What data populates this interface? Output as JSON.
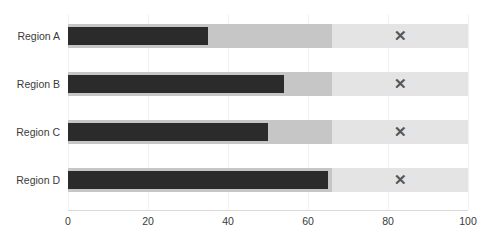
{
  "chart_data": {
    "type": "bar",
    "subtype": "bullet",
    "title": "",
    "xlabel": "",
    "ylabel": "",
    "categories": [
      "Region A",
      "Region B",
      "Region C",
      "Region D"
    ],
    "series": [
      {
        "name": "Value",
        "values": [
          35,
          54,
          50,
          65
        ]
      },
      {
        "name": "Target",
        "values": [
          83,
          83,
          83,
          83
        ]
      }
    ],
    "range_bands": [
      {
        "name": "Mid range",
        "from": 0,
        "to": 66,
        "color": "#c6c6c6"
      },
      {
        "name": "Light range",
        "from": 66,
        "to": 100,
        "color": "#e4e4e4"
      }
    ],
    "xlim": [
      0,
      100
    ],
    "xticks": [
      0,
      20,
      40,
      60,
      80,
      100
    ],
    "xtick_labels": [
      "0",
      "20",
      "40",
      "60",
      "80",
      "100"
    ],
    "gridlines": true,
    "legend": false,
    "target_marker_glyph": "✕",
    "bar_color": "#2b2b2b",
    "target_color": "#555555"
  },
  "axis": {
    "tick_labels": [
      "0",
      "20",
      "40",
      "60",
      "80",
      "100"
    ]
  },
  "rows": [
    {
      "label": "Region A",
      "value": 35,
      "target": 83
    },
    {
      "label": "Region B",
      "value": 54,
      "target": 83
    },
    {
      "label": "Region C",
      "value": 50,
      "target": 83
    },
    {
      "label": "Region D",
      "value": 65,
      "target": 83
    }
  ],
  "title": {
    "text": ""
  }
}
